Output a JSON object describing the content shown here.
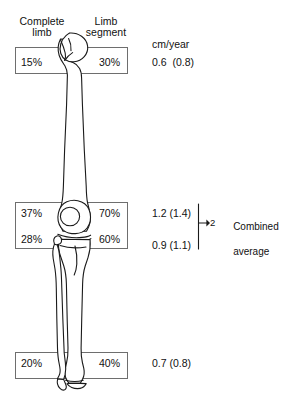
{
  "figure": {
    "headers": {
      "complete_limb": "Complete\nlimb",
      "limb_segment": "Limb\nsegment",
      "units": "cm/year"
    },
    "rows": [
      {
        "id": "proximal-femur",
        "region": "Proximal femur",
        "complete_limb_pct": "15%",
        "limb_segment_pct": "30%",
        "rate": "0.6  (0.8)"
      },
      {
        "id": "distal-femur",
        "region": "Distal femur",
        "complete_limb_pct": "37%",
        "limb_segment_pct": "70%",
        "rate": "1.2 (1.4)"
      },
      {
        "id": "proximal-tibia",
        "region": "Proximal tibia",
        "complete_limb_pct": "28%",
        "limb_segment_pct": "60%",
        "rate": "0.9 (1.1)"
      },
      {
        "id": "distal-tibia",
        "region": "Distal tibia",
        "complete_limb_pct": "20%",
        "limb_segment_pct": "40%",
        "rate": "0.7 (0.8)"
      }
    ],
    "annotation": {
      "divisor": "2",
      "label_line1": "Combined",
      "label_line2": "average",
      "arrow": "arrow-right"
    },
    "colors": {
      "background": "#ffffff",
      "ink": "#1a1a1a",
      "box_stroke": "#6e6e6e",
      "bone_stroke": "#1a1a1a",
      "bone_fill": "#ffffff"
    }
  }
}
